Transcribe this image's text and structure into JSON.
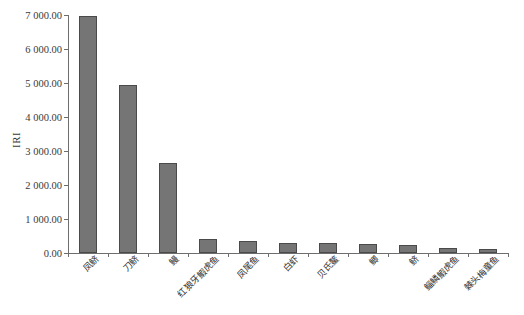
{
  "chart_data": {
    "type": "bar",
    "title": "",
    "xlabel": "",
    "ylabel": "IRI",
    "ylim": [
      0,
      7000
    ],
    "ytick_values": [
      0,
      1000,
      2000,
      3000,
      4000,
      5000,
      6000,
      7000
    ],
    "ytick_labels": [
      "0.00",
      "1 000.00",
      "2 000.00",
      "3 000.00",
      "4 000.00",
      "5 000.00",
      "6 000.00",
      "7 000.00"
    ],
    "grid": false,
    "legend": null,
    "categories": [
      "凤鲚",
      "刀鲚",
      "鳗",
      "红狼牙鰕虎鱼",
      "凤尾鱼",
      "白虾",
      "贝氏鳌",
      "鲫",
      "鲚",
      "鲻鳞鰕虎鱼",
      "棘头梅童鱼"
    ],
    "values": [
      6970,
      4950,
      2650,
      400,
      355,
      305,
      295,
      270,
      230,
      150,
      130
    ],
    "bar_color": "#757575",
    "bar_border_color": "#4a4a4a",
    "axis_color": "#6e6e6e",
    "background": "#ffffff"
  }
}
